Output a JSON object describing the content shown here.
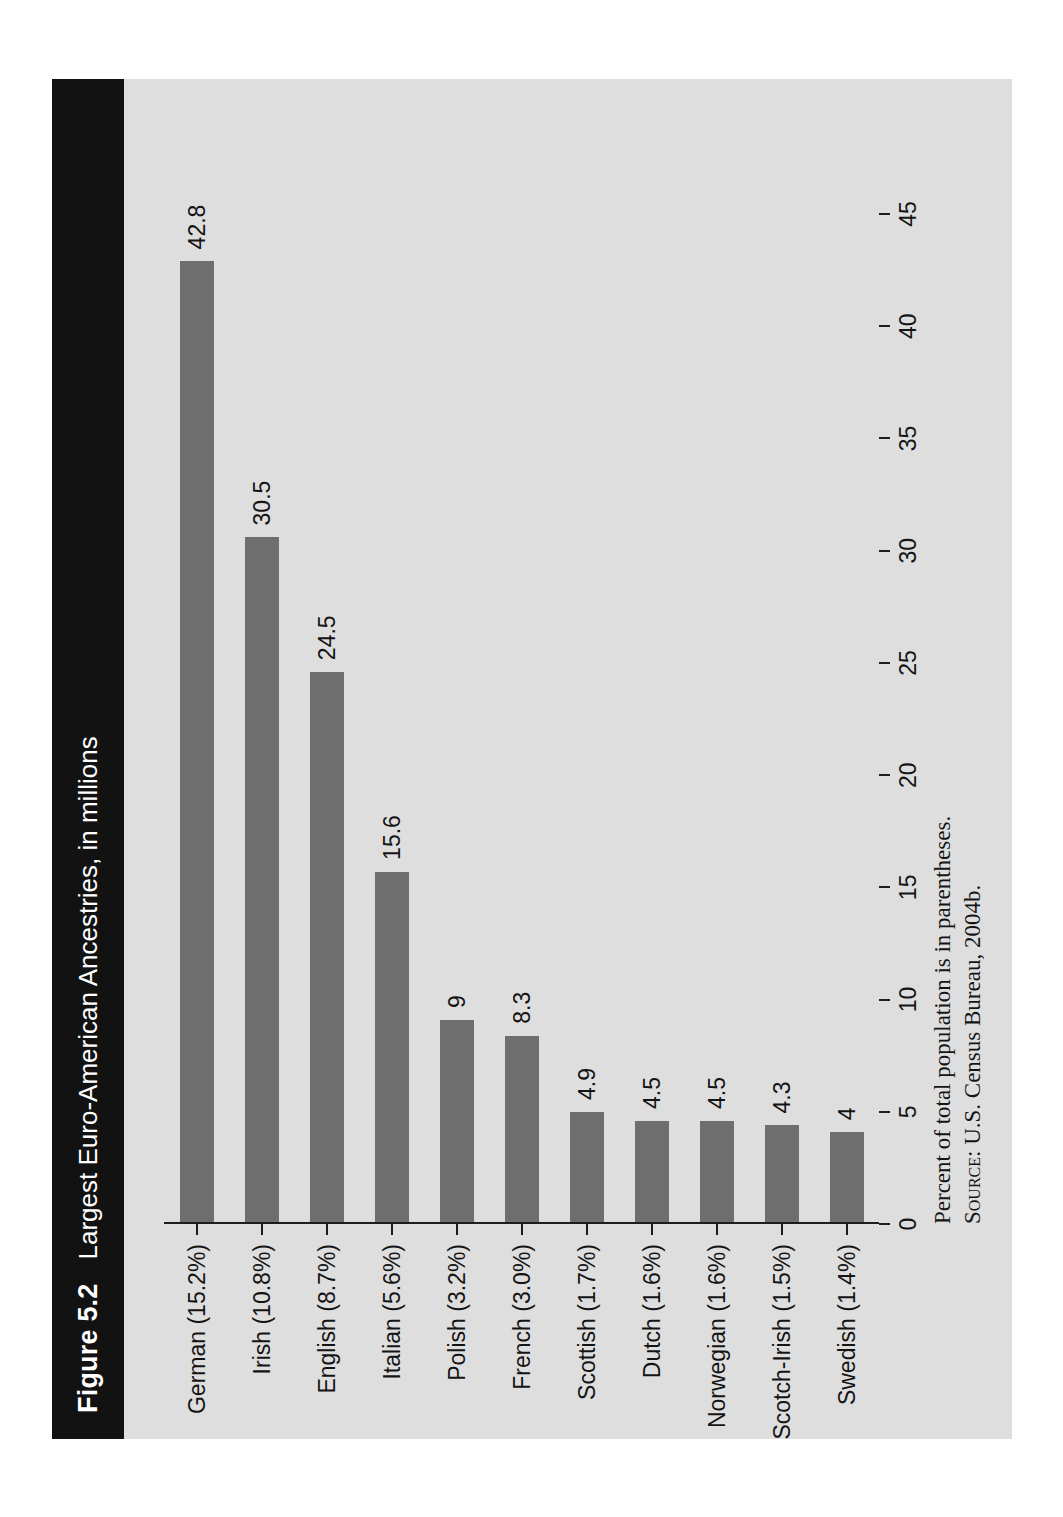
{
  "figure": {
    "number": "Figure 5.2",
    "title": "Largest Euro-American Ancestries, in millions"
  },
  "notes": {
    "line1": "Percent of total population is in parentheses.",
    "source_label": "Source:",
    "source_text": "U.S. Census Bureau, 2004b."
  },
  "colors": {
    "bar": "#6e6e6e",
    "title_bar": "#121212",
    "figure_background": "#dedede",
    "axis": "#1d1d1d",
    "text": "#141414"
  },
  "chart_data": {
    "type": "bar",
    "orientation": "vertical",
    "title": "Largest Euro-American Ancestries, in millions",
    "xlabel": "",
    "ylabel": "",
    "ylim": [
      0,
      45
    ],
    "grid": false,
    "legend": null,
    "tick_labels": [
      "0",
      "5",
      "10",
      "15",
      "20",
      "25",
      "30",
      "35",
      "40",
      "45"
    ],
    "ticks": [
      0,
      5,
      10,
      15,
      20,
      25,
      30,
      35,
      40,
      45
    ],
    "categories": [
      "German (15.2%)",
      "Irish (10.8%)",
      "English (8.7%)",
      "Italian (5.6%)",
      "Polish (3.2%)",
      "French (3.0%)",
      "Scottish (1.7%)",
      "Dutch (1.6%)",
      "Norwegian (1.6%)",
      "Scotch-Irish (1.5%)",
      "Swedish (1.4%)"
    ],
    "values": [
      42.8,
      30.5,
      24.5,
      15.6,
      9,
      8.3,
      4.9,
      4.5,
      4.5,
      4.3,
      4
    ],
    "value_labels": [
      "42.8",
      "30.5",
      "24.5",
      "15.6",
      "9",
      "8.3",
      "4.9",
      "4.5",
      "4.5",
      "4.3",
      "4"
    ],
    "percent_of_population": [
      15.2,
      10.8,
      8.7,
      5.6,
      3.2,
      3.0,
      1.7,
      1.6,
      1.6,
      1.5,
      1.4
    ],
    "units": "millions"
  }
}
